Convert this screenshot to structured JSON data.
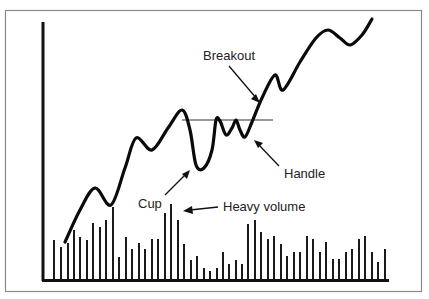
{
  "chart_data": {
    "type": "line",
    "xlabel": "",
    "ylabel": "",
    "grid": false,
    "legend": null,
    "colors": {
      "line": "#0a0a0a",
      "volume": "#1a1a1a",
      "frame": "#8a8a8a",
      "background": "#ffffff"
    },
    "price_series": {
      "name": "Price",
      "points": [
        [
          65,
          242
        ],
        [
          80,
          210
        ],
        [
          95,
          188
        ],
        [
          111,
          205
        ],
        [
          125,
          168
        ],
        [
          136,
          138
        ],
        [
          152,
          150
        ],
        [
          168,
          128
        ],
        [
          182,
          110
        ],
        [
          190,
          130
        ],
        [
          196,
          165
        ],
        [
          204,
          168
        ],
        [
          212,
          150
        ],
        [
          216,
          120
        ],
        [
          220,
          121
        ],
        [
          226,
          135
        ],
        [
          232,
          128
        ],
        [
          236,
          120
        ],
        [
          240,
          130
        ],
        [
          245,
          137
        ],
        [
          252,
          122
        ],
        [
          262,
          98
        ],
        [
          275,
          75
        ],
        [
          283,
          90
        ],
        [
          300,
          62
        ],
        [
          316,
          38
        ],
        [
          328,
          30
        ],
        [
          340,
          38
        ],
        [
          350,
          45
        ],
        [
          362,
          35
        ],
        [
          372,
          19
        ]
      ]
    },
    "volume_series": {
      "name": "Volume",
      "baseline_y": 280,
      "bars": [
        [
          54,
          240
        ],
        [
          61,
          247
        ],
        [
          68,
          243
        ],
        [
          74,
          230
        ],
        [
          80,
          237
        ],
        [
          87,
          240
        ],
        [
          93,
          223
        ],
        [
          100,
          227
        ],
        [
          106,
          220
        ],
        [
          113,
          207
        ],
        [
          119,
          257
        ],
        [
          126,
          237
        ],
        [
          132,
          249
        ],
        [
          139,
          243
        ],
        [
          145,
          249
        ],
        [
          152,
          239
        ],
        [
          158,
          239
        ],
        [
          165,
          213
        ],
        [
          171,
          204
        ],
        [
          178,
          220
        ],
        [
          184,
          244
        ],
        [
          191,
          260
        ],
        [
          197,
          256
        ],
        [
          204,
          268
        ],
        [
          210,
          271
        ],
        [
          217,
          268
        ],
        [
          223,
          252
        ],
        [
          229,
          264
        ],
        [
          236,
          260
        ],
        [
          242,
          264
        ],
        [
          248,
          224
        ],
        [
          255,
          220
        ],
        [
          261,
          232
        ],
        [
          268,
          239
        ],
        [
          274,
          236
        ],
        [
          281,
          244
        ],
        [
          287,
          256
        ],
        [
          294,
          252
        ],
        [
          300,
          252
        ],
        [
          307,
          236
        ],
        [
          313,
          239
        ],
        [
          320,
          252
        ],
        [
          326,
          242
        ],
        [
          333,
          259
        ],
        [
          339,
          259
        ],
        [
          346,
          252
        ],
        [
          352,
          249
        ],
        [
          359,
          239
        ],
        [
          365,
          236
        ],
        [
          372,
          252
        ],
        [
          378,
          262
        ],
        [
          385,
          249
        ]
      ]
    },
    "resistance_line": {
      "x1": 182,
      "x2": 273,
      "y": 120
    },
    "annotations": [
      {
        "id": "breakout",
        "text": "Breakout"
      },
      {
        "id": "handle",
        "text": "Handle"
      },
      {
        "id": "cup",
        "text": "Cup"
      },
      {
        "id": "heavy_volume",
        "text": "Heavy volume"
      }
    ]
  },
  "labels": {
    "breakout": "Breakout",
    "handle": "Handle",
    "cup": "Cup",
    "heavy_volume": "Heavy volume"
  }
}
